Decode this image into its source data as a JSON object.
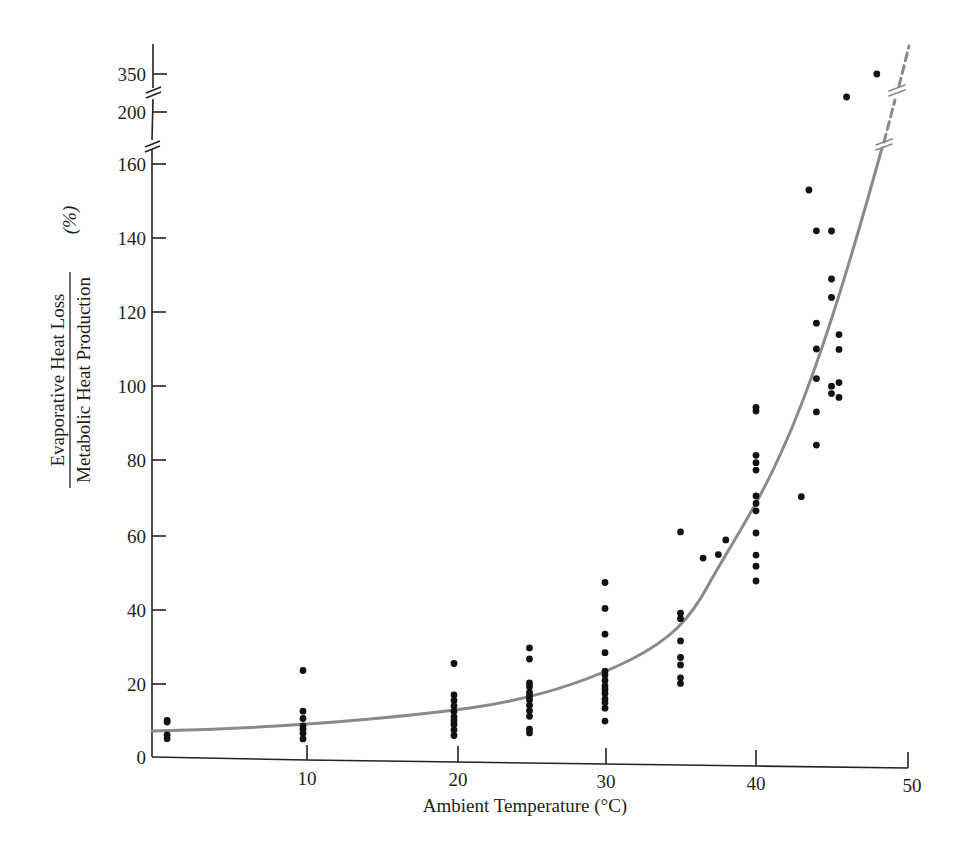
{
  "chart_data": {
    "type": "scatter",
    "title": "",
    "xlabel": "Ambient Temperature (°C)",
    "ylabel": {
      "numerator": "Evaporative Heat Loss",
      "denominator": "Metabolic Heat Production",
      "unit": "(%)"
    },
    "xlim": [
      0,
      50
    ],
    "ylim": [
      0,
      160
    ],
    "broken_y_axis_extra_ticks": [
      200,
      350
    ],
    "x_ticks": [
      "10",
      "20",
      "30",
      "40",
      "50"
    ],
    "y_ticks": [
      "0",
      "20",
      "40",
      "60",
      "80",
      "100",
      "120",
      "140",
      "160",
      "200",
      "350"
    ],
    "grid": false,
    "legend": null,
    "colors": {
      "points": "#111111",
      "curve": "#8a8a8a",
      "axis": "#222222"
    },
    "series": [
      {
        "name": "Observations",
        "type": "scatter",
        "points": [
          [
            1,
            10
          ],
          [
            1,
            9.5
          ],
          [
            1,
            6
          ],
          [
            1,
            5
          ],
          [
            10,
            24
          ],
          [
            10,
            13
          ],
          [
            10,
            11
          ],
          [
            10,
            9
          ],
          [
            10,
            8
          ],
          [
            10,
            7
          ],
          [
            10,
            5.5
          ],
          [
            20,
            26.5
          ],
          [
            20,
            18
          ],
          [
            20,
            16.5
          ],
          [
            20,
            15
          ],
          [
            20,
            13.5
          ],
          [
            20,
            12
          ],
          [
            20,
            11
          ],
          [
            20,
            10
          ],
          [
            20,
            8.5
          ],
          [
            20,
            7
          ],
          [
            25,
            31
          ],
          [
            25,
            28
          ],
          [
            25,
            21.5
          ],
          [
            25,
            20.5
          ],
          [
            25,
            19
          ],
          [
            25,
            18
          ],
          [
            25,
            17
          ],
          [
            25,
            15.5
          ],
          [
            25,
            14
          ],
          [
            25,
            12.5
          ],
          [
            25,
            9
          ],
          [
            25,
            8
          ],
          [
            30,
            49
          ],
          [
            30,
            42
          ],
          [
            30,
            35
          ],
          [
            30,
            30
          ],
          [
            30,
            25
          ],
          [
            30,
            24
          ],
          [
            30,
            22.5
          ],
          [
            30,
            21
          ],
          [
            30,
            20
          ],
          [
            30,
            19
          ],
          [
            30,
            17.5
          ],
          [
            30,
            16.5
          ],
          [
            30,
            15
          ],
          [
            30,
            11.5
          ],
          [
            35,
            63
          ],
          [
            35,
            41
          ],
          [
            35,
            39.5
          ],
          [
            35,
            33.5
          ],
          [
            35,
            29
          ],
          [
            35,
            27
          ],
          [
            35,
            23.5
          ],
          [
            35,
            22
          ],
          [
            36.5,
            56
          ],
          [
            37.5,
            57
          ],
          [
            38,
            61
          ],
          [
            40,
            97
          ],
          [
            40,
            96
          ],
          [
            40,
            84
          ],
          [
            40,
            82
          ],
          [
            40,
            80
          ],
          [
            40,
            73
          ],
          [
            40,
            71
          ],
          [
            40,
            69
          ],
          [
            40,
            63
          ],
          [
            40,
            57
          ],
          [
            40,
            54
          ],
          [
            40,
            50
          ],
          [
            43,
            73
          ],
          [
            43.5,
            156
          ],
          [
            44,
            145
          ],
          [
            44,
            120
          ],
          [
            44,
            113
          ],
          [
            44,
            105
          ],
          [
            44,
            96
          ],
          [
            44,
            87
          ],
          [
            45,
            145
          ],
          [
            45,
            132
          ],
          [
            45,
            127
          ],
          [
            45,
            103
          ],
          [
            45,
            101
          ],
          [
            45.5,
            117
          ],
          [
            45.5,
            113
          ],
          [
            45.5,
            104
          ],
          [
            45.5,
            100
          ],
          [
            46,
            220
          ],
          [
            48,
            350
          ]
        ]
      },
      {
        "name": "Fitted curve",
        "type": "line",
        "x": [
          0,
          5,
          10,
          15,
          20,
          25,
          30,
          33,
          35,
          38,
          40,
          42,
          44,
          46,
          48
        ],
        "y": [
          7,
          7.5,
          8.5,
          10.5,
          13,
          17,
          24,
          30,
          37,
          52,
          72,
          94,
          118,
          143,
          165
        ],
        "continuation": "dashed, beyond axis break to 350"
      }
    ]
  }
}
